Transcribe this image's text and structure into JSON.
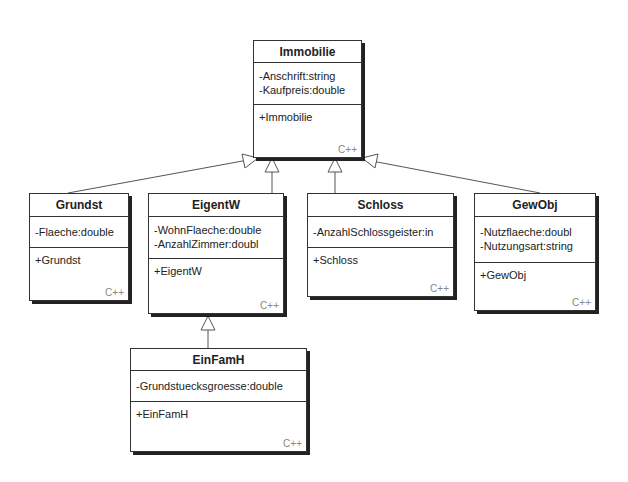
{
  "diagram": {
    "type": "UML class diagram",
    "classes": [
      {
        "id": "immobilie",
        "name": "Immobilie",
        "attributes": [
          "-Anschrift:string",
          "-Kaufpreis:double"
        ],
        "operations": [
          "+Immobilie"
        ],
        "language": "C++"
      },
      {
        "id": "grundst",
        "name": "Grundst",
        "attributes": [
          "-Flaeche:double"
        ],
        "operations": [
          "+Grundst"
        ],
        "language": "C++"
      },
      {
        "id": "eigentw",
        "name": "EigentW",
        "attributes": [
          "-WohnFlaeche:double",
          "-AnzahlZimmer:doubl"
        ],
        "operations": [
          "+EigentW"
        ],
        "language": "C++"
      },
      {
        "id": "schloss",
        "name": "Schloss",
        "attributes": [
          "-AnzahlSchlossgeister:in"
        ],
        "operations": [
          "+Schloss"
        ],
        "language": "C++"
      },
      {
        "id": "gewobj",
        "name": "GewObj",
        "attributes": [
          "-Nutzflaeche:doubl",
          "-Nutzungsart:string"
        ],
        "operations": [
          "+GewObj"
        ],
        "language": "C++"
      },
      {
        "id": "einfamh",
        "name": "EinFamH",
        "attributes": [
          "-Grundstuecksgroesse:double"
        ],
        "operations": [
          "+EinFamH"
        ],
        "language": "C++"
      }
    ],
    "generalizations": [
      {
        "child": "Grundst",
        "parent": "Immobilie"
      },
      {
        "child": "EigentW",
        "parent": "Immobilie"
      },
      {
        "child": "Schloss",
        "parent": "Immobilie"
      },
      {
        "child": "GewObj",
        "parent": "Immobilie"
      },
      {
        "child": "EinFamH",
        "parent": "EigentW"
      }
    ]
  }
}
